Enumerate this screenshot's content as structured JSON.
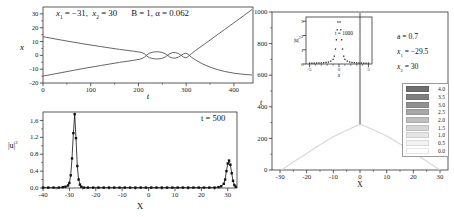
{
  "panelA": {
    "ann_x1_base": "x",
    "ann_x1_sub": "1",
    "ann_x1_mid": " = −31,  ",
    "ann_x2_base": "x",
    "ann_x2_sub": "2",
    "ann_x2_end": " = 30",
    "ann_params": "B = 1, α = 0.062",
    "xlabel": "t",
    "ylabel": "x"
  },
  "panelB": {
    "annotation": "t = 500",
    "xlabel": "X",
    "ylabel_base": "|u|",
    "ylabel_sup": "2"
  },
  "panelC": {
    "ann_a": "a = 0.7",
    "ann_x1_base": "x",
    "ann_x1_sub": "1",
    "ann_x1_rest": " = −29.5",
    "ann_x2_base": "x",
    "ann_x2_sub": "2",
    "ann_x2_rest": " = 30",
    "xlabel": "X",
    "ylabel": "t",
    "legend": {
      "entries": [
        {
          "value": "4.0",
          "color": "#6f6f6f"
        },
        {
          "value": "3.5",
          "color": "#7f7f7f"
        },
        {
          "value": "3.0",
          "color": "#919191"
        },
        {
          "value": "2.5",
          "color": "#a8a8a8"
        },
        {
          "value": "2.0",
          "color": "#bfbfbf"
        },
        {
          "value": "1.5",
          "color": "#d6d6d6"
        },
        {
          "value": "1.0",
          "color": "#e5e5e5"
        },
        {
          "value": "0.5",
          "color": "#f2f2f2"
        },
        {
          "value": "0.0",
          "color": "#ffffff"
        }
      ]
    }
  },
  "inset": {
    "annotation": "t = 1000",
    "xlabel": "x",
    "ylabel_base": "|u|",
    "ylabel_sup": "2"
  },
  "chart_data": [
    {
      "id": "panelA",
      "type": "line",
      "title": "soliton trajectories x(t)",
      "xlabel": "t",
      "ylabel": "x",
      "annotation": "x1 = -31, x2 = 30, B = 1, alpha = 0.062",
      "xlim": [
        0,
        440
      ],
      "ylim": [
        -20,
        35
      ],
      "xticks": [
        0,
        100,
        200,
        300,
        400
      ],
      "xtick_labels": [
        "0",
        "100",
        "200",
        "300",
        "400"
      ],
      "xticks_minor": [
        50,
        150,
        250,
        350
      ],
      "yticks": [
        -20,
        -10,
        0,
        10,
        20,
        30
      ],
      "ytick_labels": [
        "-20",
        "-10",
        "0",
        "10",
        "20",
        "30"
      ],
      "yticks_minor": [
        -15,
        -5,
        5,
        15,
        25
      ],
      "grid": false,
      "legend_position": "none",
      "series": [
        {
          "name": "soliton-trajectory-1",
          "color": "#555555",
          "width": 0.9,
          "points": [
            [
              0,
              13.5
            ],
            [
              40,
              11
            ],
            [
              80,
              8.6
            ],
            [
              120,
              6.4
            ],
            [
              160,
              4.3
            ],
            [
              190,
              3
            ],
            [
              205,
              2.2
            ],
            [
              212,
              1.3
            ],
            [
              217,
              -0.4
            ],
            [
              223,
              -1.7
            ],
            [
              231,
              -2.4
            ],
            [
              240,
              -2.6
            ],
            [
              249,
              -2.2
            ],
            [
              256,
              -1.2
            ],
            [
              262,
              0.2
            ],
            [
              266,
              1.3
            ],
            [
              271,
              1.9
            ],
            [
              277,
              2
            ],
            [
              283,
              1.4
            ],
            [
              289,
              0.2
            ],
            [
              294,
              -1.1
            ],
            [
              298,
              -1.7
            ],
            [
              302,
              -1.4
            ],
            [
              306,
              -0.3
            ],
            [
              311,
              1.2
            ],
            [
              320,
              3.6
            ],
            [
              340,
              8.6
            ],
            [
              360,
              13.6
            ],
            [
              380,
              18.6
            ],
            [
              400,
              23.6
            ],
            [
              420,
              28.6
            ],
            [
              438,
              33.2
            ]
          ]
        },
        {
          "name": "soliton-trajectory-2",
          "color": "#555555",
          "width": 0.9,
          "points": [
            [
              0,
              -15
            ],
            [
              40,
              -12.4
            ],
            [
              80,
              -9.8
            ],
            [
              120,
              -7.4
            ],
            [
              160,
              -5.1
            ],
            [
              190,
              -3.6
            ],
            [
              205,
              -2.6
            ],
            [
              212,
              -1.5
            ],
            [
              217,
              0.2
            ],
            [
              223,
              1.6
            ],
            [
              231,
              2.4
            ],
            [
              240,
              2.6
            ],
            [
              249,
              2.2
            ],
            [
              256,
              1.2
            ],
            [
              262,
              -0.2
            ],
            [
              266,
              -1.3
            ],
            [
              271,
              -1.9
            ],
            [
              277,
              -2
            ],
            [
              283,
              -1.4
            ],
            [
              289,
              -0.2
            ],
            [
              294,
              1
            ],
            [
              298,
              1.6
            ],
            [
              302,
              1.3
            ],
            [
              306,
              0.2
            ],
            [
              311,
              -1.3
            ],
            [
              320,
              -3.4
            ],
            [
              335,
              -6.3
            ],
            [
              350,
              -8.5
            ],
            [
              365,
              -10.2
            ],
            [
              380,
              -11.6
            ],
            [
              400,
              -12.9
            ],
            [
              420,
              -13.7
            ],
            [
              438,
              -14.2
            ]
          ]
        }
      ]
    },
    {
      "id": "panelB",
      "type": "line",
      "title": "|u|^2 profile at t = 500",
      "xlabel": "X",
      "ylabel": "|u|^2",
      "annotation": "t = 500",
      "xlim": [
        -40,
        33.5
      ],
      "ylim": [
        0,
        1.8
      ],
      "xticks": [
        -40,
        -30,
        -20,
        -10,
        0,
        10,
        20,
        30
      ],
      "xtick_labels": [
        "-40",
        "-30",
        "-20",
        "-10",
        "0",
        "10",
        "20",
        "30"
      ],
      "xticks_minor": [
        -35,
        -25,
        -15,
        -5,
        5,
        15,
        25
      ],
      "yticks": [
        0,
        0.4,
        0.8,
        1.2,
        1.6
      ],
      "ytick_labels": [
        "0.0",
        "0.4",
        "0.8",
        "1.2",
        "1.6"
      ],
      "yticks_minor": [
        0.2,
        0.6,
        1.0,
        1.4
      ],
      "grid": false,
      "legend_position": "none",
      "series": [
        {
          "name": "profile-t500",
          "color": "#111111",
          "width": 0.8,
          "markers": true,
          "marker_size": 2.4,
          "points": [
            [
              -40,
              0.01
            ],
            [
              -38,
              0.01
            ],
            [
              -36,
              0.01
            ],
            [
              -34,
              0.01
            ],
            [
              -32.5,
              0.02
            ],
            [
              -31.5,
              0.03
            ],
            [
              -30.5,
              0.06
            ],
            [
              -30,
              0.12
            ],
            [
              -29.5,
              0.3
            ],
            [
              -29,
              0.7
            ],
            [
              -28.5,
              1.3
            ],
            [
              -28,
              1.75
            ],
            [
              -27.5,
              1.18
            ],
            [
              -27,
              0.52
            ],
            [
              -26.5,
              0.2
            ],
            [
              -26,
              0.08
            ],
            [
              -25.5,
              0.03
            ],
            [
              -24.5,
              0.01
            ],
            [
              -23,
              0.01
            ],
            [
              -21,
              0.01
            ],
            [
              -19,
              0.01
            ],
            [
              -17,
              0.01
            ],
            [
              -15,
              0.01
            ],
            [
              -13,
              0.01
            ],
            [
              -11,
              0.01
            ],
            [
              -9,
              0.01
            ],
            [
              -7,
              0.01
            ],
            [
              -5,
              0.01
            ],
            [
              -3,
              0.01
            ],
            [
              -1,
              0.01
            ],
            [
              1,
              0.01
            ],
            [
              3,
              0.01
            ],
            [
              5,
              0.01
            ],
            [
              7,
              0.01
            ],
            [
              9,
              0.01
            ],
            [
              11,
              0.01
            ],
            [
              13,
              0.01
            ],
            [
              15,
              0.01
            ],
            [
              17,
              0.01
            ],
            [
              19,
              0.01
            ],
            [
              21,
              0.01
            ],
            [
              23,
              0.01
            ],
            [
              25,
              0.01
            ],
            [
              26.5,
              0.02
            ],
            [
              27.5,
              0.04
            ],
            [
              28.5,
              0.1
            ],
            [
              29,
              0.2
            ],
            [
              29.5,
              0.4
            ],
            [
              30,
              0.58
            ],
            [
              30.5,
              0.65
            ],
            [
              31,
              0.55
            ],
            [
              31.5,
              0.35
            ],
            [
              32,
              0.17
            ],
            [
              32.5,
              0.07
            ],
            [
              33,
              0.03
            ]
          ]
        }
      ]
    },
    {
      "id": "panelC",
      "type": "line",
      "title": "space-time soliton density, a = 0.7, x1 = -29.5, x2 = 30",
      "xlabel": "X",
      "ylabel": "t",
      "xlim": [
        -33,
        33
      ],
      "ylim": [
        0,
        1000
      ],
      "xticks": [
        -30,
        -20,
        -10,
        0,
        10,
        20,
        30
      ],
      "xtick_labels": [
        "-30",
        "-20",
        "-10",
        "0",
        "10",
        "20",
        "30"
      ],
      "xticks_minor": [
        -25,
        -15,
        -5,
        5,
        15,
        25
      ],
      "yticks": [
        0,
        200,
        400,
        600,
        800,
        1000
      ],
      "ytick_labels": [
        "0",
        "200",
        "400",
        "600",
        "800",
        "1000"
      ],
      "yticks_minor": [
        100,
        300,
        500,
        700,
        900
      ],
      "grid": false,
      "legend_position": "inside-lower-right",
      "colorbar_values": [
        4.0,
        3.5,
        3.0,
        2.5,
        2.0,
        1.5,
        1.0,
        0.5,
        0.0
      ],
      "series": [
        {
          "name": "incoming-soliton-left",
          "color": "#d8d8d8",
          "width": 1.2,
          "points": [
            [
              -29.5,
              0
            ],
            [
              -25,
              50
            ],
            [
              -20,
              105
            ],
            [
              -15,
              160
            ],
            [
              -10,
              210
            ],
            [
              -5,
              252
            ],
            [
              -1.5,
              278
            ],
            [
              0,
              288
            ]
          ]
        },
        {
          "name": "incoming-soliton-right",
          "color": "#d8d8d8",
          "width": 1.2,
          "points": [
            [
              30,
              0
            ],
            [
              25,
              55
            ],
            [
              20,
              110
            ],
            [
              15,
              165
            ],
            [
              10,
              215
            ],
            [
              5,
              255
            ],
            [
              1.5,
              280
            ],
            [
              0,
              288
            ]
          ]
        },
        {
          "name": "merged-soliton",
          "color": "#a9a9a9",
          "width": 2.2,
          "points": [
            [
              0,
              288
            ],
            [
              0,
              1000
            ]
          ]
        }
      ]
    },
    {
      "id": "inset",
      "type": "scatter",
      "title": "|u|^2 profile at t = 1000 (inset)",
      "xlabel": "x",
      "ylabel": "|u|^2",
      "annotation": "t = 1000",
      "xlim": [
        -5.6,
        5.6
      ],
      "ylim": [
        0,
        3.3
      ],
      "xticks": [
        -5,
        0,
        5
      ],
      "xtick_labels": [
        "-5",
        "0",
        "5"
      ],
      "xticks_minor": [
        -4,
        -3,
        -2,
        -1,
        1,
        2,
        3,
        4
      ],
      "yticks": [
        0,
        1,
        2,
        3
      ],
      "ytick_labels": [
        "0",
        "1",
        "2",
        "3"
      ],
      "grid": false,
      "legend_position": "none",
      "series": [
        {
          "name": "profile-t1000",
          "color": "#222222",
          "width": 0.5,
          "line": false,
          "markers": true,
          "marker_size": 1.3,
          "points": [
            [
              -5,
              0.06
            ],
            [
              -4.6,
              0.06
            ],
            [
              -4.2,
              0.06
            ],
            [
              -3.8,
              0.07
            ],
            [
              -3.4,
              0.07
            ],
            [
              -3,
              0.08
            ],
            [
              -2.6,
              0.09
            ],
            [
              -2.2,
              0.11
            ],
            [
              -1.8,
              0.14
            ],
            [
              -1.4,
              0.2
            ],
            [
              -1,
              0.33
            ],
            [
              -0.8,
              0.55
            ],
            [
              -0.6,
              1.05
            ],
            [
              -0.45,
              1.7
            ],
            [
              -0.3,
              2.4
            ],
            [
              -0.18,
              2.95
            ],
            [
              0.18,
              2.95
            ],
            [
              0.3,
              2.4
            ],
            [
              0.45,
              1.7
            ],
            [
              0.6,
              1.05
            ],
            [
              0.8,
              0.55
            ],
            [
              1,
              0.33
            ],
            [
              1.4,
              0.2
            ],
            [
              1.8,
              0.14
            ],
            [
              2.2,
              0.11
            ],
            [
              2.6,
              0.09
            ],
            [
              3,
              0.08
            ],
            [
              3.4,
              0.07
            ],
            [
              3.8,
              0.07
            ],
            [
              4.2,
              0.06
            ],
            [
              4.6,
              0.06
            ],
            [
              5,
              0.06
            ]
          ]
        }
      ]
    }
  ]
}
